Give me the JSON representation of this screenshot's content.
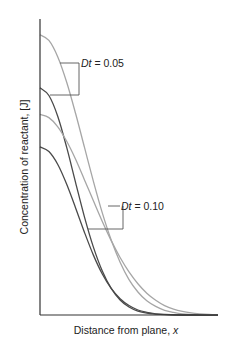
{
  "chart_data": {
    "type": "line",
    "title": "",
    "xlabel": "Distance from plane, ",
    "xlabel_var": "x",
    "ylabel": "Concentration of reactant, [J]",
    "xlim": [
      0,
      1
    ],
    "ylim": [
      0,
      1
    ],
    "grid": false,
    "ticks": "none",
    "x": [
      0,
      0.05,
      0.1,
      0.15,
      0.2,
      0.25,
      0.3,
      0.35,
      0.4,
      0.45,
      0.5,
      0.55,
      0.6,
      0.65,
      0.7,
      0.75,
      0.8,
      0.85,
      0.9,
      0.95,
      1.0
    ],
    "series": [
      {
        "name": "Dt = 0.05 (light)",
        "group": "Dt = 0.05",
        "color": "#a6a6a6",
        "values": [
          0.95,
          0.931,
          0.875,
          0.789,
          0.683,
          0.568,
          0.453,
          0.346,
          0.254,
          0.179,
          0.12,
          0.078,
          0.048,
          0.029,
          0.016,
          0.009,
          0.004,
          0.002,
          0.001,
          0.0,
          0.0
        ]
      },
      {
        "name": "Dt = 0.05 (dark)",
        "group": "Dt = 0.05",
        "color": "#4a4a4a",
        "values": [
          0.77,
          0.744,
          0.673,
          0.568,
          0.449,
          0.332,
          0.23,
          0.149,
          0.09,
          0.051,
          0.027,
          0.013,
          0.006,
          0.003,
          0.001,
          0.0,
          0.0,
          0.0,
          0.0,
          0.0,
          0.0
        ]
      },
      {
        "name": "Dt = 0.10 (light)",
        "group": "Dt = 0.10",
        "color": "#a6a6a6",
        "values": [
          0.68,
          0.669,
          0.638,
          0.589,
          0.528,
          0.458,
          0.387,
          0.317,
          0.252,
          0.195,
          0.146,
          0.106,
          0.074,
          0.05,
          0.032,
          0.02,
          0.012,
          0.007,
          0.004,
          0.002,
          0.001
        ]
      },
      {
        "name": "Dt = 0.10 (dark)",
        "group": "Dt = 0.10",
        "color": "#4a4a4a",
        "values": [
          0.57,
          0.554,
          0.51,
          0.443,
          0.363,
          0.28,
          0.203,
          0.139,
          0.09,
          0.055,
          0.032,
          0.017,
          0.009,
          0.004,
          0.002,
          0.001,
          0.0,
          0.0,
          0.0,
          0.0,
          0.0
        ]
      }
    ],
    "annotations": [
      {
        "label_var": "Dt",
        "label_rest": " = 0.05",
        "targets": [
          "Dt = 0.05 (light)",
          "Dt = 0.05 (dark)"
        ]
      },
      {
        "label_var": "Dt",
        "label_rest": " = 0.10",
        "targets": [
          "Dt = 0.10 (light)",
          "Dt = 0.10 (dark)"
        ]
      }
    ]
  }
}
